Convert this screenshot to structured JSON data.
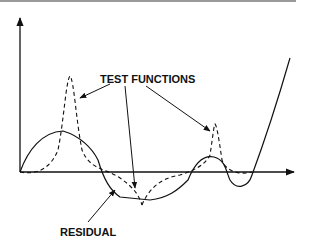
{
  "diagram": {
    "labels": {
      "test_functions": "TEST FUNCTIONS",
      "residual": "RESIDUAL"
    },
    "colors": {
      "line": "#111111",
      "top_rule": "#9a9a9a"
    },
    "elements": [
      "y-axis",
      "x-axis",
      "residual-curve (solid)",
      "test-function curves (dashed)",
      "annotation arrows"
    ]
  }
}
